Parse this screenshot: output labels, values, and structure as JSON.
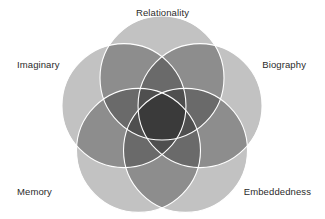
{
  "figure": {
    "kind": "five-set-venn-diagram",
    "width": 325,
    "height": 219,
    "background_color": "#ffffff",
    "outline_color": "#ffffff",
    "outline_width": 1.1,
    "center": {
      "x": 162,
      "y": 118
    },
    "circle_radius": 62,
    "center_offset": 40,
    "fill_levels": {
      "one": "#c2c2c2",
      "two": "#8d8d8d",
      "three": "#6a6a6a",
      "four": "#4f4f4f",
      "five": "#3a3a3a"
    }
  },
  "sets": [
    {
      "id": "relationality",
      "label": "Relationality",
      "angle_deg": -90,
      "label_position": "top"
    },
    {
      "id": "biography",
      "label": "Biography",
      "angle_deg": -18,
      "label_position": "right-upper"
    },
    {
      "id": "embeddedness",
      "label": "Embeddedness",
      "angle_deg": 54,
      "label_position": "right-lower"
    },
    {
      "id": "memory",
      "label": "Memory",
      "angle_deg": 126,
      "label_position": "left-lower"
    },
    {
      "id": "imaginary",
      "label": "Imaginary",
      "angle_deg": 198,
      "label_position": "left-upper"
    }
  ],
  "labels": {
    "relationality": "Relationality",
    "imaginary": "Imaginary",
    "biography": "Biography",
    "memory": "Memory",
    "embeddedness": "Embeddedness"
  }
}
